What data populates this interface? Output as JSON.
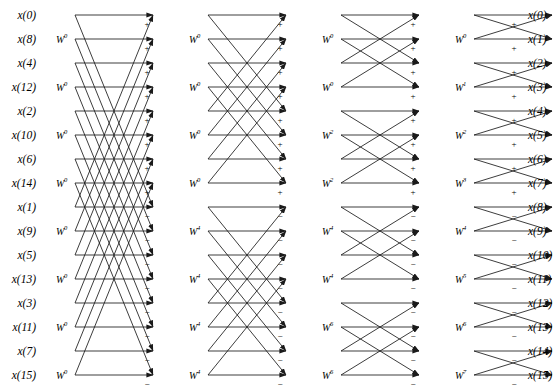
{
  "figure": {
    "type": "butterfly-diagram",
    "n_points": 16,
    "n_stages": 4,
    "line_color": "#1a1a1a",
    "background_color": "#ffffff",
    "text_color": "#000000"
  },
  "inputs": {
    "label_prefix": "x",
    "order": "bit-reversed",
    "items": [
      {
        "index": 0,
        "label": "x(0)"
      },
      {
        "index": 1,
        "label": "x(8)"
      },
      {
        "index": 2,
        "label": "x(4)"
      },
      {
        "index": 3,
        "label": "x(12)"
      },
      {
        "index": 4,
        "label": "x(2)"
      },
      {
        "index": 5,
        "label": "x(10)"
      },
      {
        "index": 6,
        "label": "x(6)"
      },
      {
        "index": 7,
        "label": "x(14)"
      },
      {
        "index": 8,
        "label": "x(1)"
      },
      {
        "index": 9,
        "label": "x(9)"
      },
      {
        "index": 10,
        "label": "x(5)"
      },
      {
        "index": 11,
        "label": "x(13)"
      },
      {
        "index": 12,
        "label": "x(3)"
      },
      {
        "index": 13,
        "label": "x(11)"
      },
      {
        "index": 14,
        "label": "x(7)"
      },
      {
        "index": 15,
        "label": "x(15)"
      }
    ]
  },
  "outputs": {
    "label_prefix": "x",
    "order": "natural",
    "items": [
      {
        "index": 0,
        "label": "x(0)"
      },
      {
        "index": 1,
        "label": "x(1)"
      },
      {
        "index": 2,
        "label": "x(2)"
      },
      {
        "index": 3,
        "label": "x(3)"
      },
      {
        "index": 4,
        "label": "x(4)"
      },
      {
        "index": 5,
        "label": "x(5)"
      },
      {
        "index": 6,
        "label": "x(6)"
      },
      {
        "index": 7,
        "label": "x(7)"
      },
      {
        "index": 8,
        "label": "x(8)"
      },
      {
        "index": 9,
        "label": "x(9)"
      },
      {
        "index": 10,
        "label": "x(10)"
      },
      {
        "index": 11,
        "label": "x(11)"
      },
      {
        "index": 12,
        "label": "x(12)"
      },
      {
        "index": 13,
        "label": "x(13)"
      },
      {
        "index": 14,
        "label": "x(14)"
      },
      {
        "index": 15,
        "label": "x(15)"
      }
    ]
  },
  "stages": [
    {
      "number": 1,
      "twiddles": [
        {
          "row": 1,
          "base": "W",
          "exp": "0"
        },
        {
          "row": 3,
          "base": "W",
          "exp": "0"
        },
        {
          "row": 5,
          "base": "W",
          "exp": "0"
        },
        {
          "row": 7,
          "base": "W",
          "exp": "0"
        },
        {
          "row": 9,
          "base": "W",
          "exp": "0"
        },
        {
          "row": 11,
          "base": "W",
          "exp": "0"
        },
        {
          "row": 13,
          "base": "W",
          "exp": "0"
        },
        {
          "row": 15,
          "base": "W",
          "exp": "0"
        }
      ]
    },
    {
      "number": 2,
      "twiddles": [
        {
          "row": 1,
          "base": "W",
          "exp": "0"
        },
        {
          "row": 3,
          "base": "W",
          "exp": "0"
        },
        {
          "row": 5,
          "base": "W",
          "exp": "0"
        },
        {
          "row": 7,
          "base": "W",
          "exp": "0"
        },
        {
          "row": 9,
          "base": "W",
          "exp": "4"
        },
        {
          "row": 11,
          "base": "W",
          "exp": "4"
        },
        {
          "row": 13,
          "base": "W",
          "exp": "4"
        },
        {
          "row": 15,
          "base": "W",
          "exp": "4"
        }
      ]
    },
    {
      "number": 3,
      "twiddles": [
        {
          "row": 1,
          "base": "W",
          "exp": "0"
        },
        {
          "row": 3,
          "base": "W",
          "exp": "0"
        },
        {
          "row": 5,
          "base": "W",
          "exp": "2"
        },
        {
          "row": 7,
          "base": "W",
          "exp": "2"
        },
        {
          "row": 9,
          "base": "W",
          "exp": "4"
        },
        {
          "row": 11,
          "base": "W",
          "exp": "4"
        },
        {
          "row": 13,
          "base": "W",
          "exp": "6"
        },
        {
          "row": 15,
          "base": "W",
          "exp": "6"
        }
      ]
    },
    {
      "number": 4,
      "twiddles": [
        {
          "row": 1,
          "base": "W",
          "exp": "0"
        },
        {
          "row": 3,
          "base": "W",
          "exp": "1"
        },
        {
          "row": 5,
          "base": "W",
          "exp": "2"
        },
        {
          "row": 7,
          "base": "W",
          "exp": "3"
        },
        {
          "row": 9,
          "base": "W",
          "exp": "4"
        },
        {
          "row": 11,
          "base": "W",
          "exp": "5"
        },
        {
          "row": 13,
          "base": "W",
          "exp": "6"
        },
        {
          "row": 15,
          "base": "W",
          "exp": "7"
        }
      ]
    }
  ],
  "signs": {
    "plus": "+",
    "minus": "−",
    "per_stage_rows": [
      "+",
      "+",
      "+",
      "+",
      "+",
      "+",
      "+",
      "+",
      "−",
      "−",
      "−",
      "−",
      "−",
      "−",
      "−",
      "−"
    ]
  },
  "geometry": {
    "row_top": 15,
    "row_step": 24,
    "rows": 16,
    "stage_starts": [
      75,
      208,
      341,
      474
    ],
    "stage_width": 78,
    "input_label_x": 36,
    "output_label_x": 528,
    "twiddle_offsets": [
      56,
      189,
      322,
      455
    ],
    "sign_offsets": [
      147,
      280,
      413,
      546
    ]
  }
}
